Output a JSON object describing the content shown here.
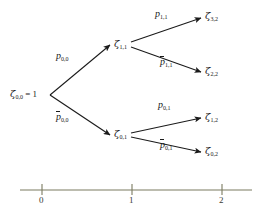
{
  "figure": {
    "type": "binomial-lattice-tree",
    "stroke_color": "#1a1a1a",
    "axis_color": "#7a7a60"
  },
  "nodes": [
    {
      "id": "root",
      "label_zeta": "ζ",
      "label_sub": "0,0",
      "suffix": " = 1",
      "x": 10,
      "y": 95,
      "period": 0
    },
    {
      "id": "up",
      "label_zeta": "ζ",
      "label_sub": "1,1",
      "suffix": "",
      "x": 114,
      "y": 45,
      "period": 1
    },
    {
      "id": "down",
      "label_zeta": "ζ",
      "label_sub": "0,1",
      "suffix": "",
      "x": 114,
      "y": 135,
      "period": 1
    },
    {
      "id": "uu",
      "label_zeta": "ζ",
      "label_sub": "3,2",
      "suffix": "",
      "x": 205,
      "y": 17,
      "period": 2
    },
    {
      "id": "ud",
      "label_zeta": "ζ",
      "label_sub": "2,2",
      "suffix": "",
      "x": 205,
      "y": 72,
      "period": 2
    },
    {
      "id": "du",
      "label_zeta": "ζ",
      "label_sub": "1,2",
      "suffix": "",
      "x": 205,
      "y": 118,
      "period": 2
    },
    {
      "id": "dd",
      "label_zeta": "ζ",
      "label_sub": "0,2",
      "suffix": "",
      "x": 205,
      "y": 152,
      "period": 2
    }
  ],
  "edges": [
    {
      "id": "root-up",
      "from": "root",
      "to": "up",
      "prob_symbol": "p",
      "prob_sub": "0,0",
      "overline": false,
      "label_x": 56,
      "label_y": 57
    },
    {
      "id": "root-down",
      "from": "root",
      "to": "down",
      "prob_symbol": "p",
      "prob_sub": "0,0",
      "overline": true,
      "label_x": 56,
      "label_y": 118
    },
    {
      "id": "up-uu",
      "from": "up",
      "to": "uu",
      "prob_symbol": "p",
      "prob_sub": "1,1",
      "overline": false,
      "label_x": 155,
      "label_y": 15
    },
    {
      "id": "up-ud",
      "from": "up",
      "to": "ud",
      "prob_symbol": "p",
      "prob_sub": "1,1",
      "overline": true,
      "label_x": 160,
      "label_y": 63
    },
    {
      "id": "down-du",
      "from": "down",
      "to": "du",
      "prob_symbol": "p",
      "prob_sub": "0,1",
      "overline": false,
      "label_x": 158,
      "label_y": 106
    },
    {
      "id": "down-dd",
      "from": "down",
      "to": "dd",
      "prob_symbol": "p",
      "prob_sub": "0,1",
      "overline": true,
      "label_x": 160,
      "label_y": 146
    }
  ],
  "axis": {
    "y": 190,
    "x_start": 20,
    "x_end": 252,
    "ticks": [
      {
        "label": "0",
        "x": 42
      },
      {
        "label": "1",
        "x": 132
      },
      {
        "label": "2",
        "x": 222
      }
    ]
  }
}
